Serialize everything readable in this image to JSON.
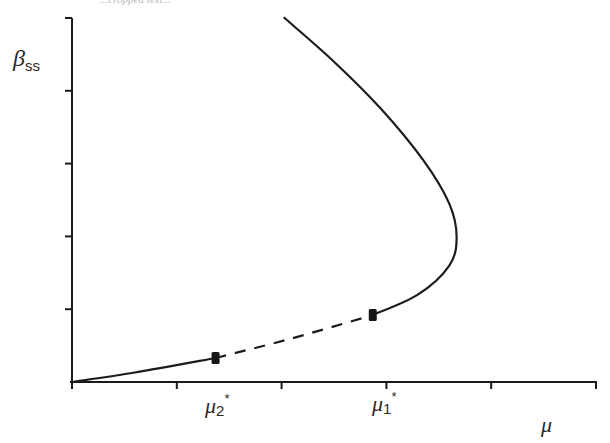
{
  "chart_data": {
    "type": "line",
    "title": "",
    "header_fragment": "...cropped text...",
    "xlabel": "μ",
    "ylabel": "β",
    "ylabel_sub": "ss",
    "xlim": [
      0,
      5
    ],
    "ylim": [
      0,
      5
    ],
    "x_ticks": [
      0,
      1,
      2,
      3,
      4,
      5
    ],
    "y_ticks": [
      0,
      1,
      2,
      3,
      4,
      5
    ],
    "tick_labels_shown": false,
    "grid": false,
    "annotations": [
      {
        "label": "μ",
        "sub": "2",
        "sup": "*",
        "x": 1.37
      },
      {
        "label": "μ",
        "sub": "1",
        "sup": "*",
        "x": 2.87
      }
    ],
    "series": [
      {
        "name": "stable-lower",
        "style": "solid",
        "points": [
          [
            0,
            0
          ],
          [
            0.6,
            0.13
          ],
          [
            1.37,
            0.33
          ]
        ]
      },
      {
        "name": "unstable",
        "style": "dashed",
        "points": [
          [
            1.37,
            0.33
          ],
          [
            2.1,
            0.6
          ],
          [
            2.87,
            0.92
          ]
        ]
      },
      {
        "name": "stable-upper",
        "style": "solid",
        "points": [
          [
            2.87,
            0.92
          ],
          [
            3.3,
            1.2
          ],
          [
            3.6,
            1.6
          ],
          [
            3.67,
            1.99
          ],
          [
            3.6,
            2.45
          ],
          [
            3.35,
            3.05
          ],
          [
            2.95,
            3.75
          ],
          [
            2.5,
            4.4
          ],
          [
            2.02,
            5.01
          ]
        ]
      }
    ],
    "markers": [
      {
        "name": "bifurcation-point-mu2",
        "x": 1.37,
        "y": 0.33
      },
      {
        "name": "bifurcation-point-mu1",
        "x": 2.87,
        "y": 0.92
      }
    ]
  }
}
